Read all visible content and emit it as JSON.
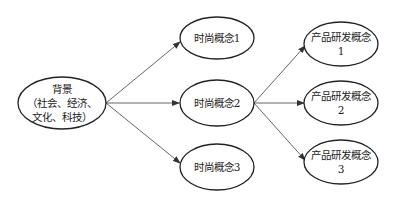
{
  "colors": {
    "stroke": "#222222",
    "edge": "#555555",
    "text": "#222222",
    "background": "#ffffff"
  },
  "nodes": {
    "background": {
      "line1": "背景",
      "line2": "（社会、经济、",
      "line3": "文化、科技）"
    },
    "fashion1": {
      "label": "时尚概念1"
    },
    "fashion2": {
      "label": "时尚概念2"
    },
    "fashion3": {
      "label": "时尚概念3"
    },
    "product1": {
      "line1": "产品研发概念",
      "line2": "1"
    },
    "product2": {
      "line1": "产品研发概念",
      "line2": "2"
    },
    "product3": {
      "line1": "产品研发概念",
      "line2": "3"
    }
  },
  "edges": [
    {
      "from": "background",
      "to": "fashion1"
    },
    {
      "from": "background",
      "to": "fashion2"
    },
    {
      "from": "background",
      "to": "fashion3"
    },
    {
      "from": "fashion2",
      "to": "product1"
    },
    {
      "from": "fashion2",
      "to": "product2"
    },
    {
      "from": "fashion2",
      "to": "product3"
    }
  ]
}
